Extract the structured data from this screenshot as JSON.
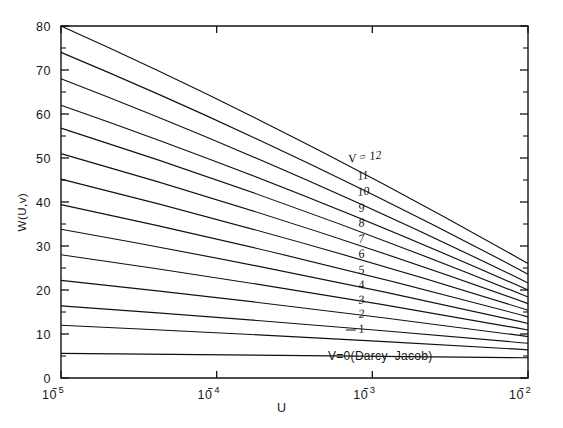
{
  "chart_data": {
    "type": "line",
    "title": "",
    "subtitle": "",
    "xlabel": "U",
    "ylabel": "W(U,v)",
    "xscale": "log",
    "x_direction": "decreasing",
    "xlim": [
      100000,
      100
    ],
    "ylim": [
      0,
      80
    ],
    "grid": false,
    "legend_position": "inline-right",
    "x_tick_labels": [
      "10⁵",
      "10⁴",
      "10³",
      "10²"
    ],
    "x_tick_mantissa": [
      "10",
      "10",
      "10",
      "10"
    ],
    "x_tick_exponents": [
      "5",
      "4",
      "3",
      "2"
    ],
    "x_tick_values": [
      100000,
      10000,
      1000,
      100
    ],
    "y_tick_labels": [
      "0",
      "10",
      "20",
      "30",
      "40",
      "50",
      "60",
      "70",
      "80"
    ],
    "y_tick_values": [
      0,
      10,
      20,
      30,
      40,
      50,
      60,
      70,
      80
    ],
    "y_minor_tick_values": [
      5,
      15,
      25,
      35,
      45,
      55,
      65,
      75
    ],
    "annotations": [
      {
        "text": "V = 12",
        "series": "12"
      },
      {
        "text": "11",
        "series": "11"
      },
      {
        "text": "10",
        "series": "10"
      },
      {
        "text": "9",
        "series": "9"
      },
      {
        "text": "8",
        "series": "8"
      },
      {
        "text": "7",
        "series": "7"
      },
      {
        "text": "6",
        "series": "6"
      },
      {
        "text": "5",
        "series": "5"
      },
      {
        "text": "4",
        "series": "4"
      },
      {
        "text": "3",
        "series": "3"
      },
      {
        "text": "2",
        "series": "2"
      },
      {
        "text": "1",
        "series": "1"
      },
      {
        "text": "V=0(Darcy–Jacob)",
        "series": "0"
      }
    ],
    "series": [
      {
        "name": "V = 12",
        "label": "V = 12",
        "x": [
          100000,
          100
        ],
        "values": [
          80.0,
          26.0
        ]
      },
      {
        "name": "11",
        "label": "11",
        "x": [
          100000,
          100
        ],
        "values": [
          74.0,
          23.6
        ]
      },
      {
        "name": "10",
        "label": "10",
        "x": [
          100000,
          100
        ],
        "values": [
          68.0,
          21.6
        ]
      },
      {
        "name": "9",
        "label": "9",
        "x": [
          100000,
          100
        ],
        "values": [
          62.0,
          20.0
        ]
      },
      {
        "name": "8",
        "label": "8",
        "x": [
          100000,
          100
        ],
        "values": [
          56.8,
          18.4
        ]
      },
      {
        "name": "7",
        "label": "7",
        "x": [
          100000,
          100
        ],
        "values": [
          51.0,
          16.9
        ]
      },
      {
        "name": "6",
        "label": "6",
        "x": [
          100000,
          100
        ],
        "values": [
          45.2,
          15.4
        ]
      },
      {
        "name": "5",
        "label": "5",
        "x": [
          100000,
          100
        ],
        "values": [
          39.4,
          13.9
        ]
      },
      {
        "name": "4",
        "label": "4",
        "x": [
          100000,
          100
        ],
        "values": [
          33.8,
          12.4
        ]
      },
      {
        "name": "3",
        "label": "3",
        "x": [
          100000,
          100
        ],
        "values": [
          28.0,
          10.9
        ]
      },
      {
        "name": "2",
        "label": "2",
        "x": [
          100000,
          100
        ],
        "values": [
          22.2,
          9.4
        ]
      },
      {
        "name": "1",
        "label": "1",
        "x": [
          100000,
          100
        ],
        "values": [
          16.4,
          7.9
        ]
      },
      {
        "name": "1b",
        "label": "",
        "x": [
          100000,
          100
        ],
        "values": [
          12.0,
          6.4
        ]
      },
      {
        "name": "0",
        "label": "V=0(Darcy–Jacob)",
        "x": [
          100000,
          100
        ],
        "values": [
          5.6,
          4.6
        ]
      }
    ]
  },
  "colors": {
    "line": "#101010",
    "axis": "#141414",
    "text": "#161616",
    "background": "#ffffff"
  }
}
